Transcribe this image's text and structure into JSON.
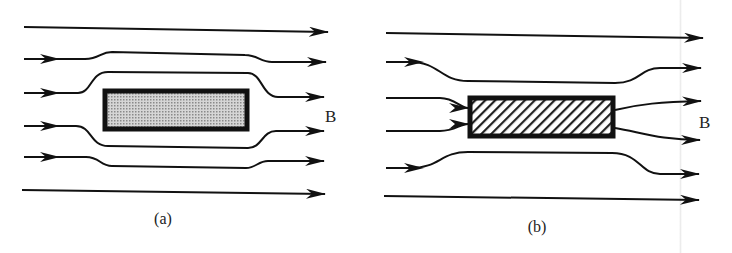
{
  "figure": {
    "panels": [
      {
        "id": "a",
        "caption": "(a)",
        "field_label": "B",
        "description": "Field lines bend around a shaded (diamagnetic/superconducting) rectangle",
        "sample_fill": "dotted-gray"
      },
      {
        "id": "b",
        "caption": "(b)",
        "field_label": "B",
        "description": "Field lines converge into a hatched (paramagnetic) rectangle",
        "sample_fill": "diagonal-hatch"
      }
    ],
    "colors": {
      "line": "#111111",
      "sample_gray": "#b8b8b8",
      "background": "#ffffff"
    }
  }
}
